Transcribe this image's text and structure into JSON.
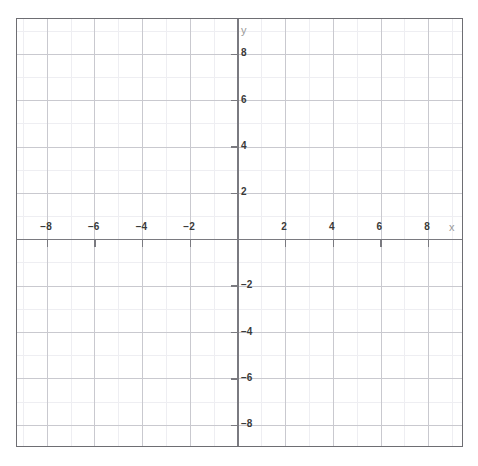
{
  "caption": {
    "text": "· · · · · · · · · · · ·"
  },
  "chart_data": {
    "type": "scatter",
    "title": "",
    "subtitle": "",
    "xlabel": "x",
    "ylabel": "y",
    "xlim": [
      -9.25,
      9.5
    ],
    "ylim": [
      -9.0,
      9.5
    ],
    "grid": true,
    "minor_grid": true,
    "major_tick_step": 2,
    "minor_tick_step": 1,
    "legend": false,
    "legend_position": "none",
    "series": [],
    "annotations": [],
    "x_tick_values": [
      -8,
      -6,
      -4,
      -2,
      2,
      4,
      6,
      8
    ],
    "x_tick_labels": [
      "−8",
      "−6",
      "−4",
      "−2",
      "2",
      "4",
      "6",
      "8"
    ],
    "y_tick_values": [
      8,
      6,
      4,
      2,
      -2,
      -4,
      -6,
      -8
    ],
    "y_tick_labels": [
      "8",
      "6",
      "4",
      "2",
      "−2",
      "−4",
      "−6",
      "−8"
    ],
    "origin_label": ""
  },
  "style": {
    "background": "#ffffff",
    "frame_color": "#6e6e73",
    "axis_color": "#7a7a80",
    "major_grid_color": "#c9c9cf",
    "minor_grid_color": "#eeeef2",
    "tick_label_color": "#3a3a3a",
    "axis_name_color": "#9a9a9a"
  },
  "axis_names": {
    "x": "x",
    "y": "y"
  }
}
